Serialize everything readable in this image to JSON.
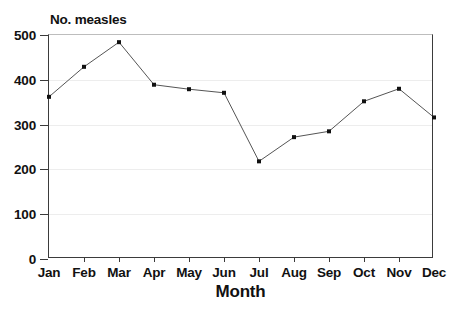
{
  "chart_data": {
    "type": "line",
    "title": "",
    "xlabel": "Month",
    "ylabel": "No. measles",
    "categories": [
      "Jan",
      "Feb",
      "Mar",
      "Apr",
      "May",
      "Jun",
      "Jul",
      "Aug",
      "Sep",
      "Oct",
      "Nov",
      "Dec"
    ],
    "values": [
      362,
      429,
      484,
      389,
      379,
      371,
      218,
      272,
      285,
      352,
      380,
      316
    ],
    "series": [
      {
        "name": "No. measles",
        "values": [
          362,
          429,
          484,
          389,
          379,
          371,
          218,
          272,
          285,
          352,
          380,
          316
        ]
      }
    ],
    "ylim": [
      0,
      500
    ],
    "y_ticks": [
      0,
      100,
      200,
      300,
      400,
      500
    ],
    "y_tick_labels": [
      "0",
      "100",
      "200",
      "300",
      "400",
      "500"
    ],
    "x_tick_labels": [
      "Jan",
      "Feb",
      "Mar",
      "Apr",
      "May",
      "Jun",
      "Jul",
      "Aug",
      "Sep",
      "Oct",
      "Nov",
      "Dec"
    ],
    "grid": true,
    "grid_axis": "y",
    "legend": false,
    "legend_position": "none",
    "marker": "square",
    "line_color": "#555555",
    "marker_color": "#111111",
    "grid_color": "#ededed",
    "axis_color": "#3b3b3b",
    "background_color": "#ffffff"
  },
  "axis": {
    "y_title": "No. measles",
    "x_title": "Month"
  }
}
